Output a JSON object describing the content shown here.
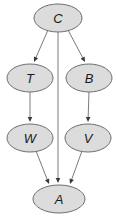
{
  "diagram": {
    "background_color": "#ffffff",
    "node_fill_color": "#dcdcdc",
    "node_stroke_color": "#6e6e6e",
    "edge_color": "#7a7a7a",
    "arrowhead_color": "#3a3a3a",
    "label_color": "#1a1a1a",
    "nodes": [
      {
        "id": "C",
        "label": "C",
        "cx": 58,
        "cy": 18,
        "rx": 24,
        "ry": 14
      },
      {
        "id": "T",
        "label": "T",
        "cx": 30,
        "cy": 78,
        "rx": 23,
        "ry": 14
      },
      {
        "id": "B",
        "label": "B",
        "cx": 89,
        "cy": 78,
        "rx": 23,
        "ry": 14
      },
      {
        "id": "W",
        "label": "W",
        "cx": 30,
        "cy": 138,
        "rx": 23,
        "ry": 14
      },
      {
        "id": "V",
        "label": "V",
        "cx": 88,
        "cy": 138,
        "rx": 23,
        "ry": 14
      },
      {
        "id": "A",
        "label": "A",
        "cx": 59,
        "cy": 199,
        "rx": 26,
        "ry": 14
      }
    ],
    "edges": [
      {
        "from": "C",
        "to": "T",
        "x1": 48,
        "y1": 30,
        "x2": 34,
        "y2": 62
      },
      {
        "from": "C",
        "to": "B",
        "x1": 68,
        "y1": 30,
        "x2": 85,
        "y2": 62
      },
      {
        "from": "C",
        "to": "A",
        "x1": 58,
        "y1": 32,
        "x2": 58,
        "y2": 183
      },
      {
        "from": "T",
        "to": "W",
        "x1": 30,
        "y1": 92,
        "x2": 30,
        "y2": 122
      },
      {
        "from": "B",
        "to": "V",
        "x1": 89,
        "y1": 92,
        "x2": 88,
        "y2": 122
      },
      {
        "from": "W",
        "to": "A",
        "x1": 36,
        "y1": 151,
        "x2": 49,
        "y2": 184
      },
      {
        "from": "V",
        "to": "A",
        "x1": 82,
        "y1": 151,
        "x2": 70,
        "y2": 184
      }
    ]
  }
}
